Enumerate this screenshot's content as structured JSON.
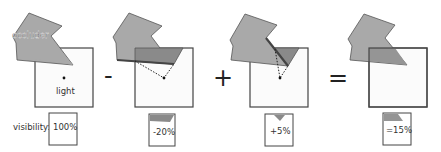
{
  "labels": {
    "occluder": "occluder",
    "light": "light",
    "visibility": "visibility:"
  },
  "operators": [
    "-",
    "+",
    "="
  ],
  "panels": [
    {
      "id": "full",
      "visibility": "100%"
    },
    {
      "id": "subtract",
      "visibility": "-20%"
    },
    {
      "id": "add",
      "visibility": "+5%"
    },
    {
      "id": "result",
      "visibility": "=15%"
    }
  ],
  "colors": {
    "occluder_fill": "#a9a9a9",
    "occluder_overlap": "#8a8a8a",
    "light_area": "#fbfbfb",
    "outline": "#444444"
  }
}
